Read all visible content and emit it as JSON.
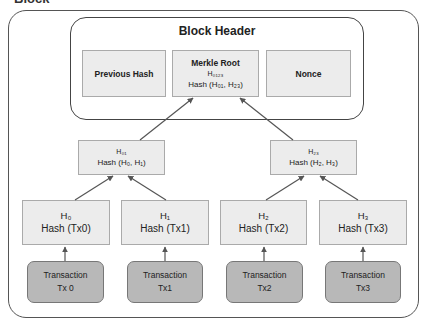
{
  "diagram": {
    "outer_title": "Block",
    "header": {
      "title": "Block Header",
      "fields": [
        {
          "label": "Previous Hash"
        },
        {
          "label": "Merkle Root",
          "sub": "H₀₁₂₃",
          "detail": "Hash (H₀₁, H₂₃)"
        },
        {
          "label": "Nonce"
        }
      ]
    },
    "intermediate": [
      {
        "name": "H₀₁",
        "formula": "Hash (H₀, H₁)"
      },
      {
        "name": "H₂₃",
        "formula": "Hash (H₂, H₃)"
      }
    ],
    "leaves": [
      {
        "name": "H₀",
        "formula": "Hash (Tx0)"
      },
      {
        "name": "H₁",
        "formula": "Hash (Tx1)"
      },
      {
        "name": "H₂",
        "formula": "Hash (Tx2)"
      },
      {
        "name": "H₃",
        "formula": "Hash (Tx3)"
      }
    ],
    "transactions": [
      {
        "label": "Transaction",
        "id": "Tx 0"
      },
      {
        "label": "Transaction",
        "id": "Tx1"
      },
      {
        "label": "Transaction",
        "id": "Tx2"
      },
      {
        "label": "Transaction",
        "id": "Tx3"
      }
    ],
    "colors": {
      "hash_box": "#ececec",
      "transaction_box": "#b8b8b8",
      "arrow": "#555555"
    }
  }
}
